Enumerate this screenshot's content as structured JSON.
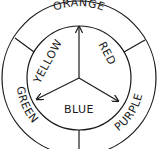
{
  "primary_colors": [
    "YELLOW",
    "RED",
    "BLUE"
  ],
  "secondary_colors": [
    "ORANGE",
    "PURPLE",
    "GREEN"
  ],
  "labels": {
    "orange": "ORANGE",
    "red": "RED",
    "purple": "PURPLE",
    "blue": "BLUE",
    "green": "GREEN",
    "yellow": "YELLOW"
  }
}
